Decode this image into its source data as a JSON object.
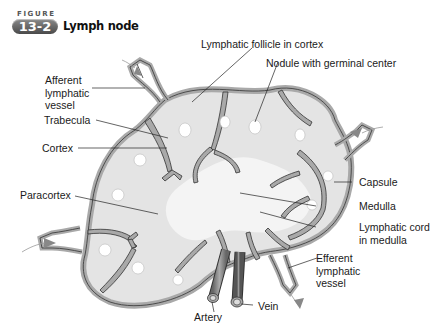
{
  "figure": {
    "label": "FIGURE",
    "number": "13-2",
    "title": "Lymph node"
  },
  "labels": {
    "afferent_lymphatic_vessel": "Afferent\nlymphatic\nvessel",
    "lymphatic_follicle": "Lymphatic follicle in cortex",
    "nodule_germinal_center": "Nodule with germinal center",
    "trabecula": "Trabecula",
    "cortex": "Cortex",
    "capsule": "Capsule",
    "paracortex": "Paracortex",
    "medulla": "Medulla",
    "lymphatic_cord": "Lymphatic cord\nin medulla",
    "efferent_lymphatic_vessel": "Efferent\nlymphatic\nvessel",
    "artery": "Artery",
    "vein": "Vein"
  },
  "colors": {
    "capsule_fill": "#a9a9a9",
    "node_fill": "#e4e4e4",
    "medulla_fill": "#f4f4f4",
    "outline": "#333333",
    "badge": "#666666"
  }
}
